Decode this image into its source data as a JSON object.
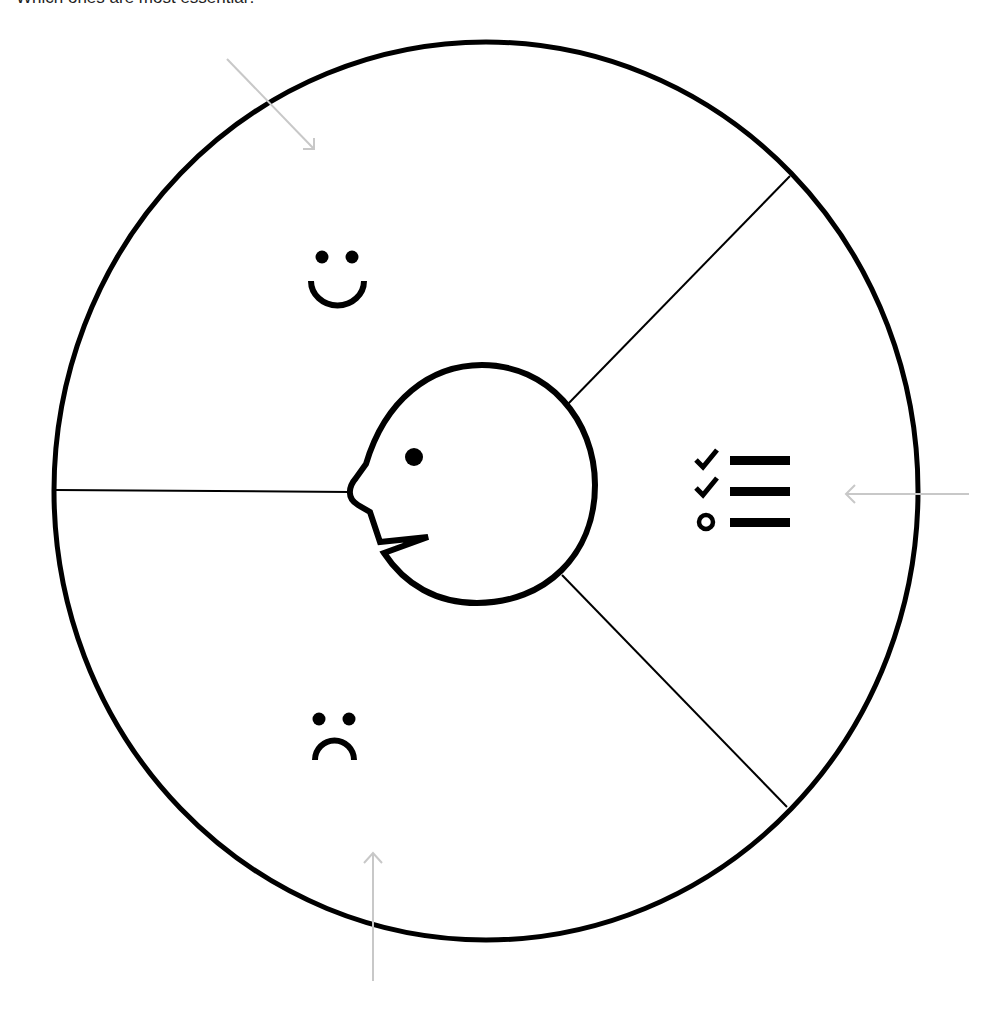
{
  "caption": "Which ones are most essential?",
  "diagram": {
    "outer_circle": {
      "cx": 486,
      "cy": 491,
      "rx": 432,
      "ry": 449
    },
    "segments": [
      {
        "name": "positive",
        "icon": "smiley-face-icon"
      },
      {
        "name": "tasks",
        "icon": "checklist-icon"
      },
      {
        "name": "negative",
        "icon": "frowning-face-icon"
      }
    ],
    "center": {
      "icon": "speaking-head-icon"
    },
    "arrow_color": "#c8c8c8",
    "stroke_color": "#000000"
  }
}
